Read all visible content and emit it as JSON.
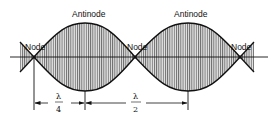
{
  "diagram": {
    "labels": {
      "node_left": "Node",
      "antinode_left": "Antinode",
      "node_center": "Node",
      "antinode_right": "Antinode",
      "node_right": "Node"
    },
    "dimensions": {
      "quarter": {
        "numerator": "λ",
        "denominator": "4"
      },
      "half": {
        "numerator": "λ",
        "denominator": "2"
      }
    },
    "colors": {
      "stroke": "#111111",
      "hatch": "#555555",
      "fill": "#d8d8d8",
      "background": "#ffffff"
    }
  }
}
